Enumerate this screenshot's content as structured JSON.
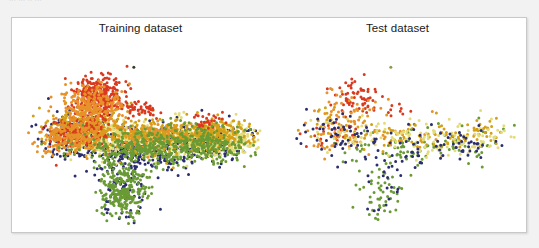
{
  "caption_fragment": "...  ... ..  ...",
  "figure": {
    "background": "#ffffff",
    "border_color": "#c8c8c8"
  },
  "panels": [
    {
      "id": "training",
      "title": "Training dataset"
    },
    {
      "id": "test",
      "title": "Test dataset"
    }
  ],
  "palette": {
    "red": "#d93a1f",
    "orange": "#e8912a",
    "gold": "#d4a017",
    "pale_yellow": "#e3dc78",
    "green": "#6a9a33",
    "navy": "#2b2d6e"
  },
  "chart_data": [
    {
      "type": "scatter",
      "title": "Training dataset",
      "xlabel": "",
      "ylabel": "",
      "grid": false,
      "legend": "none",
      "axes_visible": false,
      "xlim": [
        0,
        100
      ],
      "ylim": [
        0,
        100
      ],
      "point_size": 1.5,
      "approx_point_count": 4200,
      "series": [
        {
          "name": "red",
          "color": "#d93a1f",
          "n": 560,
          "clusters": [
            {
              "cx": 30.5,
              "cy": 72.0,
              "sx": 5.0,
              "sy": 5.5,
              "n": 330
            },
            {
              "cx": 22.0,
              "cy": 52.0,
              "sx": 6.5,
              "sy": 4.0,
              "n": 150
            },
            {
              "cx": 47.0,
              "cy": 64.0,
              "sx": 5.0,
              "sy": 2.5,
              "n": 50
            },
            {
              "cx": 76.0,
              "cy": 56.0,
              "sx": 4.0,
              "sy": 2.5,
              "n": 30
            }
          ]
        },
        {
          "name": "orange",
          "color": "#e8912a",
          "n": 520,
          "clusters": [
            {
              "cx": 27.0,
              "cy": 66.0,
              "sx": 7.0,
              "sy": 6.0,
              "n": 250
            },
            {
              "cx": 19.0,
              "cy": 50.0,
              "sx": 7.5,
              "sy": 4.5,
              "n": 180
            },
            {
              "cx": 52.0,
              "cy": 49.0,
              "sx": 9.0,
              "sy": 3.5,
              "n": 90
            }
          ]
        },
        {
          "name": "gold",
          "color": "#d4a017",
          "n": 760,
          "clusters": [
            {
              "cx": 24.0,
              "cy": 56.0,
              "sx": 8.5,
              "sy": 6.0,
              "n": 260
            },
            {
              "cx": 55.0,
              "cy": 49.0,
              "sx": 13.0,
              "sy": 4.5,
              "n": 300
            },
            {
              "cx": 80.0,
              "cy": 48.0,
              "sx": 8.0,
              "sy": 4.0,
              "n": 200
            }
          ]
        },
        {
          "name": "pale_yellow",
          "color": "#e3dc78",
          "n": 800,
          "clusters": [
            {
              "cx": 30.0,
              "cy": 52.0,
              "sx": 9.0,
              "sy": 5.0,
              "n": 200
            },
            {
              "cx": 58.0,
              "cy": 47.0,
              "sx": 14.0,
              "sy": 5.0,
              "n": 350
            },
            {
              "cx": 83.0,
              "cy": 45.0,
              "sx": 8.5,
              "sy": 4.5,
              "n": 250
            }
          ]
        },
        {
          "name": "green",
          "color": "#6a9a33",
          "n": 820,
          "clusters": [
            {
              "cx": 50.0,
              "cy": 43.0,
              "sx": 14.0,
              "sy": 5.5,
              "n": 330
            },
            {
              "cx": 76.0,
              "cy": 43.0,
              "sx": 10.0,
              "sy": 5.0,
              "n": 210
            },
            {
              "cx": 41.0,
              "cy": 20.0,
              "sx": 5.0,
              "sy": 7.5,
              "n": 280
            }
          ]
        },
        {
          "name": "navy",
          "color": "#2b2d6e",
          "n": 740,
          "clusters": [
            {
              "cx": 22.0,
              "cy": 52.0,
              "sx": 8.5,
              "sy": 5.5,
              "n": 200
            },
            {
              "cx": 48.0,
              "cy": 42.0,
              "sx": 13.0,
              "sy": 6.0,
              "n": 300
            },
            {
              "cx": 78.0,
              "cy": 44.0,
              "sx": 9.0,
              "sy": 5.0,
              "n": 170
            },
            {
              "cx": 41.0,
              "cy": 20.0,
              "sx": 4.5,
              "sy": 7.0,
              "n": 70
            }
          ]
        }
      ],
      "outliers": [
        {
          "x": 45.5,
          "cy": 87.0,
          "color": "#3a3a28"
        }
      ]
    },
    {
      "type": "scatter",
      "title": "Test dataset",
      "xlabel": "",
      "ylabel": "",
      "grid": false,
      "legend": "none",
      "axes_visible": false,
      "xlim": [
        0,
        100
      ],
      "ylim": [
        0,
        100
      ],
      "point_size": 1.5,
      "approx_point_count": 760,
      "series": [
        {
          "name": "red",
          "color": "#d93a1f",
          "n": 95,
          "clusters": [
            {
              "cx": 30.5,
              "cy": 72.0,
              "sx": 5.0,
              "sy": 5.5,
              "n": 60
            },
            {
              "cx": 22.0,
              "cy": 52.0,
              "sx": 6.5,
              "sy": 4.0,
              "n": 25
            },
            {
              "cx": 47.0,
              "cy": 64.0,
              "sx": 5.0,
              "sy": 2.5,
              "n": 10
            }
          ]
        },
        {
          "name": "orange",
          "color": "#e8912a",
          "n": 90,
          "clusters": [
            {
              "cx": 27.0,
              "cy": 66.0,
              "sx": 7.0,
              "sy": 6.0,
              "n": 45
            },
            {
              "cx": 19.0,
              "cy": 50.0,
              "sx": 7.5,
              "sy": 4.5,
              "n": 30
            },
            {
              "cx": 52.0,
              "cy": 49.0,
              "sx": 9.0,
              "sy": 3.5,
              "n": 15
            }
          ]
        },
        {
          "name": "gold",
          "color": "#d4a017",
          "n": 135,
          "clusters": [
            {
              "cx": 24.0,
              "cy": 56.0,
              "sx": 8.5,
              "sy": 6.0,
              "n": 45
            },
            {
              "cx": 55.0,
              "cy": 49.0,
              "sx": 13.0,
              "sy": 4.5,
              "n": 55
            },
            {
              "cx": 80.0,
              "cy": 48.0,
              "sx": 8.0,
              "sy": 4.0,
              "n": 35
            }
          ]
        },
        {
          "name": "pale_yellow",
          "color": "#e3dc78",
          "n": 145,
          "clusters": [
            {
              "cx": 30.0,
              "cy": 52.0,
              "sx": 9.0,
              "sy": 5.0,
              "n": 35
            },
            {
              "cx": 58.0,
              "cy": 47.0,
              "sx": 14.0,
              "sy": 5.0,
              "n": 65
            },
            {
              "cx": 83.0,
              "cy": 45.0,
              "sx": 8.5,
              "sy": 4.5,
              "n": 45
            }
          ]
        },
        {
          "name": "green",
          "color": "#6a9a33",
          "n": 150,
          "clusters": [
            {
              "cx": 50.0,
              "cy": 43.0,
              "sx": 14.0,
              "sy": 5.5,
              "n": 60
            },
            {
              "cx": 76.0,
              "cy": 43.0,
              "sx": 10.0,
              "sy": 5.0,
              "n": 40
            },
            {
              "cx": 41.0,
              "cy": 20.0,
              "sx": 5.0,
              "sy": 7.5,
              "n": 50
            }
          ]
        },
        {
          "name": "navy",
          "color": "#2b2d6e",
          "n": 145,
          "clusters": [
            {
              "cx": 22.0,
              "cy": 52.0,
              "sx": 8.5,
              "sy": 5.5,
              "n": 40
            },
            {
              "cx": 48.0,
              "cy": 42.0,
              "sx": 13.0,
              "sy": 6.0,
              "n": 55
            },
            {
              "cx": 78.0,
              "cy": 44.0,
              "sx": 9.0,
              "sy": 5.0,
              "n": 35
            },
            {
              "cx": 41.0,
              "cy": 20.0,
              "sx": 4.5,
              "sy": 7.0,
              "n": 15
            }
          ]
        }
      ],
      "outliers": [
        {
          "x": 45.5,
          "cy": 87.0,
          "color": "#8a9a55"
        }
      ]
    }
  ]
}
